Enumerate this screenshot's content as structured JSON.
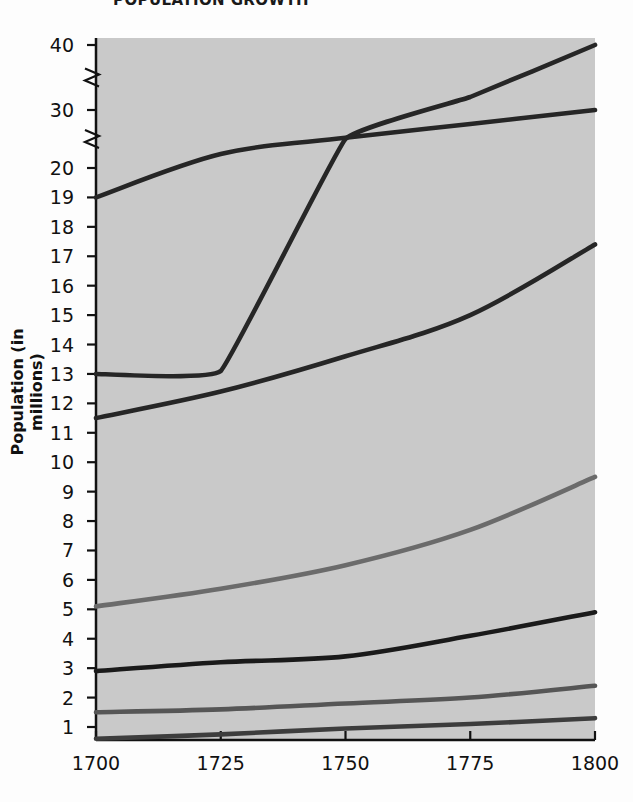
{
  "title": "POPULATION GROWTH",
  "chart_data": {
    "type": "line",
    "title": "POPULATION GROWTH",
    "xlabel": "",
    "ylabel": "Population (in millions)",
    "xlim": [
      1700,
      1800
    ],
    "ylim": [
      0,
      40
    ],
    "grid": false,
    "legend_position": "inline-labels",
    "axis_break": true,
    "axis_break_note": "y-axis compressed between 20 and 30, and between 30 and 40",
    "background_color": "#c9c9c9",
    "xticks": [
      "1700",
      "1725",
      "1750",
      "1775",
      "1800"
    ],
    "yticks": [
      "1",
      "2",
      "3",
      "4",
      "5",
      "6",
      "7",
      "8",
      "9",
      "10",
      "11",
      "12",
      "13",
      "14",
      "15",
      "16",
      "17",
      "18",
      "19",
      "20",
      "30",
      "40"
    ],
    "x": [
      1700,
      1725,
      1750,
      1775,
      1800
    ],
    "series": [
      {
        "name": "Russia",
        "color": "#262626",
        "label_x": 1733,
        "label_y": 27.4,
        "values": [
          19.0,
          22.4,
          25.2,
          27.6,
          30.0
        ]
      },
      {
        "name": "France",
        "color": "#262626",
        "label_x": 1717,
        "label_y": 18.0,
        "values": [
          13.0,
          13.1,
          25.0,
          32.0,
          40.0
        ]
      },
      {
        "name": "Italy",
        "color": "#262626",
        "label_x": 1772,
        "label_y": 17.5,
        "values": [
          11.5,
          12.4,
          13.6,
          15.0,
          17.4
        ]
      },
      {
        "name": "England",
        "color": "#6b6b6b",
        "label_x": 1768,
        "label_y": 9.6,
        "values": [
          5.1,
          5.7,
          6.5,
          7.7,
          9.5
        ]
      },
      {
        "name": "Ireland",
        "color": "#1a1a1a",
        "label_x": 1769,
        "label_y": 5.0,
        "values": [
          2.9,
          3.2,
          3.4,
          4.1,
          4.9
        ]
      },
      {
        "name": "Sweden",
        "color": "#565656",
        "label_x": 1768,
        "label_y": 2.4,
        "values": [
          1.5,
          1.6,
          1.8,
          2.0,
          2.4
        ]
      },
      {
        "name": "East Prussia",
        "color": "#3d3d3d",
        "label_x": 1756,
        "label_y": 1.4,
        "values": [
          0.6,
          0.75,
          0.95,
          1.1,
          1.3
        ]
      }
    ]
  }
}
